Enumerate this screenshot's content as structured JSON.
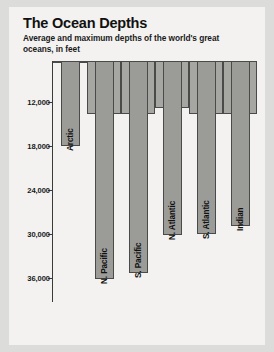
{
  "header": {
    "title": "The Ocean Depths",
    "subtitle": "Average and maximum depths of the world's great oceans, in feet"
  },
  "chart_data": {
    "type": "bar",
    "title": "The Ocean Depths",
    "subtitle": "Average and maximum depths of the world's great oceans, in feet",
    "xlabel": "",
    "ylabel": "",
    "units": "feet",
    "y_axis_inverted": true,
    "ylim": [
      0,
      38000
    ],
    "grid": false,
    "legend": "none",
    "tick_labels": [
      "12,000",
      "18,000",
      "24,000",
      "30,000",
      "36,000"
    ],
    "ticks": [
      12000,
      18000,
      24000,
      30000,
      36000
    ],
    "categories": [
      "Arctic",
      "N. Pacific",
      "S. Pacific",
      "N. Atlantic",
      "S. Atlantic",
      "Indian"
    ],
    "series": [
      {
        "name": "Average depth",
        "values": [
          3950,
          13700,
          13700,
          12800,
          13700,
          13700
        ],
        "color": "#a6a6a3"
      },
      {
        "name": "Maximum depth",
        "values": [
          18000,
          36200,
          35400,
          30200,
          30000,
          28900
        ],
        "color": "#9b9b98"
      }
    ]
  },
  "colors": {
    "page_background": "#dcdcda",
    "card_background": "#f3f2f0",
    "bar_average": "#a6a6a3",
    "bar_maximum": "#9b9b98",
    "bar_outline": "#4a4a48",
    "axis": "#3a3a3a",
    "text": "#111111"
  }
}
